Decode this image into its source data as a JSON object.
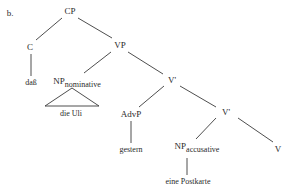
{
  "example_label": "b.",
  "nodes": {
    "cp": "CP",
    "c": "C",
    "vp": "VP",
    "np_nom": "NP",
    "np_nom_sub": "nominative",
    "vbar1": "V'",
    "advp": "AdvP",
    "vbar2": "V'",
    "np_acc": "NP",
    "np_acc_sub": "accusative",
    "v": "V"
  },
  "words": {
    "c": "daß",
    "np_nom": "die Uli",
    "advp": "gestern",
    "np_acc": "eine Postkarte"
  }
}
